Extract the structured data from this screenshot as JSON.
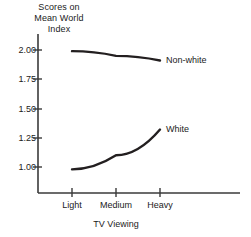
{
  "chart_data": {
    "type": "line",
    "title": "",
    "ylabel": "Scores on Mean World Index",
    "ylabel_lines": [
      "Scores on",
      "Mean World",
      "Index"
    ],
    "xlabel": "TV Viewing",
    "categories": [
      "Light",
      "Medium",
      "Heavy"
    ],
    "ylim": [
      0.88,
      2.12
    ],
    "yticks": [
      2.0,
      1.75,
      1.5,
      1.25,
      1.0
    ],
    "ytick_labels": [
      "2.00",
      "1.75",
      "1.50",
      "1.25",
      "1.00"
    ],
    "grid": false,
    "legend": "inline-right-end-labels",
    "series": [
      {
        "name": "Non-white",
        "label": "Non-white",
        "color": "#231f20",
        "values": [
          1.99,
          1.95,
          1.91
        ]
      },
      {
        "name": "White",
        "label": "White",
        "color": "#231f20",
        "values": [
          0.98,
          1.1,
          1.32
        ]
      }
    ]
  },
  "axis": {
    "line_color": "#3a3a3a"
  }
}
